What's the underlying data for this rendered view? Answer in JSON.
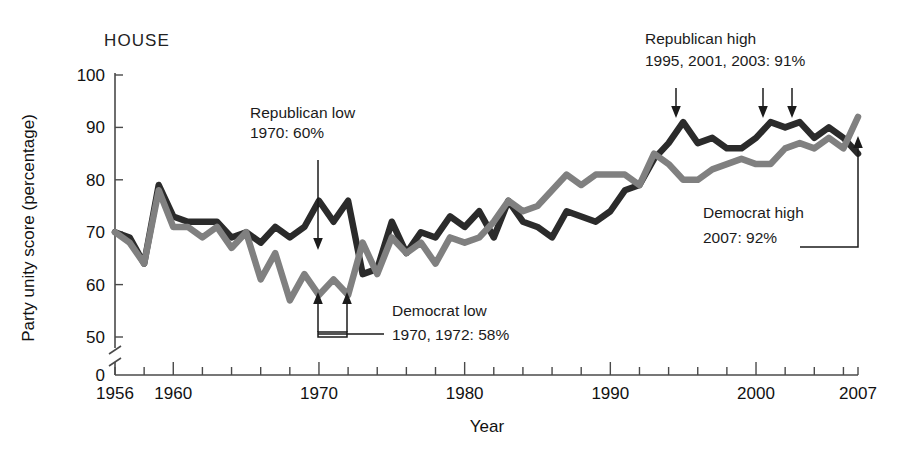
{
  "panel_label": "HOUSE",
  "axes": {
    "ylabel": "Party unity score (percentage)",
    "xlabel": "Year",
    "y_ticks": [
      "0",
      "50",
      "60",
      "70",
      "80",
      "90",
      "100"
    ],
    "x_ticks": [
      "1956",
      "1960",
      "1970",
      "1980",
      "1990",
      "2000",
      "2007"
    ]
  },
  "annotations": {
    "rep_low": {
      "line1": "Republican low",
      "line2": "1970: 60%"
    },
    "dem_low": {
      "line1": "Democrat low",
      "line2": "1970, 1972: 58%"
    },
    "rep_high": {
      "line1": "Republican high",
      "line2": "1995, 2001, 2003: 91%"
    },
    "dem_high": {
      "line1": "Democrat high",
      "line2": "2007: 92%"
    }
  },
  "colors": {
    "republican": "#2b2b2b",
    "democrat": "#808080",
    "axis": "#4a4a4a",
    "text": "#1a1a1a",
    "background": "#ffffff"
  },
  "chart_data": {
    "type": "line",
    "title": "HOUSE",
    "xlabel": "Year",
    "ylabel": "Party unity score (percentage)",
    "xlim": [
      1956,
      2007
    ],
    "ylim": [
      46,
      100
    ],
    "grid": false,
    "legend": "none",
    "axis_break_y": true,
    "x": [
      1956,
      1957,
      1958,
      1959,
      1960,
      1961,
      1962,
      1963,
      1964,
      1965,
      1966,
      1967,
      1968,
      1969,
      1970,
      1971,
      1972,
      1973,
      1974,
      1975,
      1976,
      1977,
      1978,
      1979,
      1980,
      1981,
      1982,
      1983,
      1984,
      1985,
      1986,
      1987,
      1988,
      1989,
      1990,
      1991,
      1992,
      1993,
      1994,
      1995,
      1996,
      1997,
      1998,
      1999,
      2000,
      2001,
      2002,
      2003,
      2004,
      2005,
      2006,
      2007
    ],
    "series": [
      {
        "name": "Republican",
        "color": "#2b2b2b",
        "values": [
          70,
          69,
          64,
          79,
          73,
          72,
          72,
          72,
          69,
          70,
          68,
          71,
          69,
          71,
          76,
          72,
          76,
          62,
          63,
          72,
          66,
          70,
          69,
          73,
          71,
          74,
          69,
          76,
          72,
          71,
          69,
          74,
          73,
          72,
          74,
          78,
          79,
          84,
          87,
          91,
          87,
          88,
          86,
          86,
          88,
          91,
          90,
          91,
          88,
          90,
          88,
          85
        ]
      },
      {
        "name": "Democrat",
        "color": "#808080",
        "values": [
          70,
          68,
          64,
          78,
          71,
          71,
          69,
          71,
          67,
          70,
          61,
          66,
          57,
          62,
          58,
          61,
          58,
          68,
          62,
          69,
          66,
          68,
          64,
          69,
          68,
          69,
          72,
          76,
          74,
          75,
          78,
          81,
          79,
          81,
          81,
          81,
          79,
          85,
          83,
          80,
          80,
          82,
          83,
          84,
          83,
          83,
          86,
          87,
          86,
          88,
          86,
          92
        ]
      }
    ],
    "callouts": [
      {
        "label": "Republican low",
        "year": 1970,
        "value": 60,
        "text": "1970: 60%"
      },
      {
        "label": "Democrat low",
        "year": 1970,
        "value": 58,
        "text": "1970, 1972: 58%"
      },
      {
        "label": "Democrat low 2",
        "year": 1972,
        "value": 58,
        "text": "1970, 1972: 58%"
      },
      {
        "label": "Republican high",
        "year": 1995,
        "value": 91,
        "text": "1995, 2001, 2003: 91%"
      },
      {
        "label": "Republican high 2",
        "year": 2001,
        "value": 91,
        "text": "1995, 2001, 2003: 91%"
      },
      {
        "label": "Republican high 3",
        "year": 2003,
        "value": 91,
        "text": "1995, 2001, 2003: 91%"
      },
      {
        "label": "Democrat high",
        "year": 2007,
        "value": 92,
        "text": "2007: 92%"
      }
    ]
  }
}
